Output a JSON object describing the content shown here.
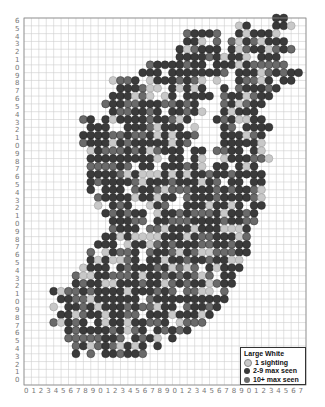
{
  "map": {
    "species": "Large White",
    "grid": {
      "cols": 38,
      "rows": 47,
      "left": 24,
      "top": 18,
      "right": 306,
      "bottom": 385
    },
    "x_labels": [
      "0",
      "1",
      "2",
      "3",
      "4",
      "5",
      "6",
      "7",
      "8",
      "9",
      "0",
      "1",
      "2",
      "3",
      "4",
      "5",
      "6",
      "7",
      "8",
      "9",
      "0",
      "1",
      "2",
      "3",
      "4",
      "5",
      "6",
      "7",
      "8",
      "9",
      "0",
      "1",
      "2",
      "3",
      "4",
      "5",
      "6",
      "7"
    ],
    "y_labels": [
      "6",
      "5",
      "4",
      "3",
      "2",
      "1",
      "0",
      "9",
      "8",
      "7",
      "6",
      "5",
      "4",
      "3",
      "2",
      "1",
      "0",
      "9",
      "8",
      "7",
      "6",
      "5",
      "4",
      "3",
      "2",
      "1",
      "0",
      "9",
      "8",
      "7",
      "6",
      "5",
      "4",
      "3",
      "2",
      "1",
      "0",
      "9",
      "8",
      "7",
      "6",
      "5",
      "4",
      "3",
      "2",
      "1",
      "0"
    ],
    "colors": {
      "one": "#c8c8c8",
      "few": "#3a3a3a",
      "many": "#6a6a6a",
      "grid": "#cfcfcf",
      "frame": "#888888"
    },
    "row_spans": [
      [
        [
          34,
          35
        ]
      ],
      [
        [
          29,
          30
        ],
        [
          34,
          36
        ]
      ],
      [
        [
          22,
          26
        ],
        [
          29,
          34
        ]
      ],
      [
        [
          22,
          26
        ],
        [
          28,
          35
        ]
      ],
      [
        [
          21,
          26
        ],
        [
          28,
          36
        ]
      ],
      [
        [
          21,
          34
        ]
      ],
      [
        [
          17,
          24
        ],
        [
          26,
          35
        ]
      ],
      [
        [
          16,
          25
        ],
        [
          26,
          37
        ]
      ],
      [
        [
          12,
          26
        ],
        [
          28,
          37
        ]
      ],
      [
        [
          13,
          24
        ],
        [
          27,
          34
        ]
      ],
      [
        [
          12,
          25
        ],
        [
          27,
          33
        ]
      ],
      [
        [
          11,
          23
        ],
        [
          27,
          32
        ]
      ],
      [
        [
          12,
          24
        ],
        [
          27,
          32
        ]
      ],
      [
        [
          8,
          22
        ],
        [
          26,
          32
        ]
      ],
      [
        [
          9,
          23
        ],
        [
          27,
          33
        ]
      ],
      [
        [
          8,
          23
        ],
        [
          27,
          32
        ]
      ],
      [
        [
          8,
          22
        ],
        [
          27,
          32
        ]
      ],
      [
        [
          9,
          24
        ],
        [
          26,
          32
        ]
      ],
      [
        [
          9,
          24
        ],
        [
          27,
          33
        ]
      ],
      [
        [
          8,
          24
        ],
        [
          26,
          32
        ]
      ],
      [
        [
          9,
          32
        ]
      ],
      [
        [
          9,
          32
        ]
      ],
      [
        [
          9,
          32
        ]
      ],
      [
        [
          10,
          32
        ]
      ],
      [
        [
          10,
          32
        ]
      ],
      [
        [
          11,
          31
        ]
      ],
      [
        [
          12,
          31
        ]
      ],
      [
        [
          12,
          30
        ]
      ],
      [
        [
          11,
          30
        ]
      ],
      [
        [
          10,
          30
        ]
      ],
      [
        [
          9,
          30
        ]
      ],
      [
        [
          9,
          29
        ]
      ],
      [
        [
          8,
          29
        ]
      ],
      [
        [
          7,
          28
        ]
      ],
      [
        [
          7,
          28
        ]
      ],
      [
        [
          4,
          27
        ]
      ],
      [
        [
          4,
          27
        ]
      ],
      [
        [
          4,
          26
        ]
      ],
      [
        [
          5,
          25
        ]
      ],
      [
        [
          4,
          24
        ]
      ],
      [
        [
          6,
          22
        ]
      ],
      [
        [
          6,
          20
        ]
      ],
      [
        [
          7,
          18
        ]
      ],
      [
        [
          7,
          16
        ]
      ],
      [],
      [],
      []
    ]
  },
  "legend": {
    "title": "Large White",
    "items": [
      {
        "label": "1 sighting",
        "key": "one"
      },
      {
        "label": "2-9 max seen",
        "key": "few"
      },
      {
        "label": "10+ max seen",
        "key": "many"
      }
    ]
  }
}
